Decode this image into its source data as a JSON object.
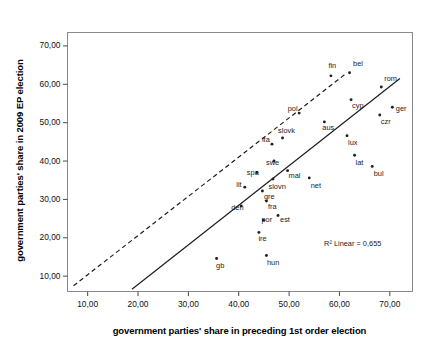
{
  "chart_data": {
    "type": "scatter",
    "title": "",
    "xlabel": "government parties' share in preceding 1st order election",
    "ylabel": "government parties' share in 2009 EP election",
    "xlim": [
      6.0,
      74.5
    ],
    "ylim": [
      6.0,
      73.5
    ],
    "xticks": [
      "10,00",
      "20,00",
      "30,00",
      "40,00",
      "50,00",
      "60,00",
      "70,00"
    ],
    "xtick_values": [
      10,
      20,
      30,
      40,
      50,
      60,
      70
    ],
    "yticks": [
      "10,00",
      "20,00",
      "30,00",
      "40,00",
      "50,00",
      "60,00",
      "70,00"
    ],
    "ytick_values": [
      10,
      20,
      30,
      40,
      50,
      60,
      70
    ],
    "grid": false,
    "legend": "none",
    "annotations": [
      {
        "name": "r2-annotation",
        "text": "R² Linear = 0,655",
        "x": 62.5,
        "y": 18.5
      }
    ],
    "reference_lines": [
      {
        "name": "diagonal-reference-line",
        "style": "dashed",
        "x0": 7.2,
        "y0": 7.5,
        "x1": 61.5,
        "y1": 63.0
      },
      {
        "name": "regression-line",
        "style": "solid",
        "x0": 18.8,
        "y0": 6.6,
        "x1": 72.0,
        "y1": 61.5
      }
    ],
    "points": [
      {
        "label": "fin",
        "x": 58.3,
        "y": 62.2,
        "lx": -2.5,
        "ly": -10.5
      },
      {
        "label": "bel",
        "x": 62.0,
        "y": 63.0,
        "lx": 3.5,
        "ly": -10.0
      },
      {
        "label": "rom",
        "x": 68.3,
        "y": 59.3,
        "lx": 3.0,
        "ly": -8.5
      },
      {
        "label": "cyp",
        "x": 62.3,
        "y": 56.0,
        "lx": 1.0,
        "ly": 5.5
      },
      {
        "label": "ger",
        "x": 70.5,
        "y": 54.0,
        "lx": 3.5,
        "ly": 0.5
      },
      {
        "label": "czr",
        "x": 68.0,
        "y": 52.0,
        "lx": 1.0,
        "ly": 6.5
      },
      {
        "label": "pol",
        "x": 52.0,
        "y": 52.5,
        "lx": -11.5,
        "ly": -5.0
      },
      {
        "label": "aus",
        "x": 57.0,
        "y": 50.2,
        "lx": -2.0,
        "ly": 5.5
      },
      {
        "label": "lux",
        "x": 61.5,
        "y": 46.6,
        "lx": 1.0,
        "ly": 6.0
      },
      {
        "label": "slovk",
        "x": 48.7,
        "y": 46.0,
        "lx": -4.5,
        "ly": -8.5
      },
      {
        "label": "ita",
        "x": 46.6,
        "y": 44.4,
        "lx": -10.0,
        "ly": -5.5
      },
      {
        "label": "lat",
        "x": 63.0,
        "y": 41.5,
        "lx": 1.0,
        "ly": 6.5
      },
      {
        "label": "swe",
        "x": 47.0,
        "y": 40.0,
        "lx": -8.0,
        "ly": 0.5
      },
      {
        "label": "bul",
        "x": 66.5,
        "y": 38.6,
        "lx": 1.5,
        "ly": 6.5
      },
      {
        "label": "mal",
        "x": 49.7,
        "y": 37.5,
        "lx": 1.0,
        "ly": 4.0
      },
      {
        "label": "spa",
        "x": 43.6,
        "y": 37.0,
        "lx": -10.0,
        "ly": -1.0
      },
      {
        "label": "net",
        "x": 54.0,
        "y": 35.6,
        "lx": 1.5,
        "ly": 7.0
      },
      {
        "label": "slovn",
        "x": 46.8,
        "y": 35.3,
        "lx": -4.5,
        "ly": 6.5
      },
      {
        "label": "lit",
        "x": 41.2,
        "y": 33.2,
        "lx": -8.5,
        "ly": -3.0
      },
      {
        "label": "gre",
        "x": 44.7,
        "y": 32.2,
        "lx": 1.5,
        "ly": 5.5
      },
      {
        "label": "fra",
        "x": 45.5,
        "y": 29.6,
        "lx": 1.5,
        "ly": 5.0
      },
      {
        "label": "den",
        "x": 40.5,
        "y": 28.3,
        "lx": -10.0,
        "ly": 1.5
      },
      {
        "label": "est",
        "x": 47.8,
        "y": 25.8,
        "lx": 2.0,
        "ly": 3.5
      },
      {
        "label": "por",
        "x": 44.9,
        "y": 24.6,
        "lx": -2.0,
        "ly": -1.0
      },
      {
        "label": "ire",
        "x": 44.0,
        "y": 21.4,
        "lx": -0.5,
        "ly": 5.5
      },
      {
        "label": "hun",
        "x": 45.5,
        "y": 15.4,
        "lx": 0.5,
        "ly": 6.5
      },
      {
        "label": "gb",
        "x": 35.6,
        "y": 14.6,
        "lx": -0.5,
        "ly": 6.5
      }
    ]
  }
}
